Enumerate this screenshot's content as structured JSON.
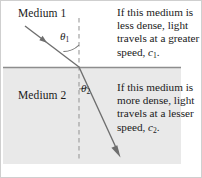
{
  "figure": {
    "background_color": "#ffffff",
    "border_color": "#cfcfcf",
    "ray_color": "#6e6e6e",
    "medium2_fill": "#e8e8e8",
    "interface_line_color": "#8a8a8a",
    "normal_line_color": "#9a9a9a"
  },
  "labels": {
    "medium1": "Medium 1",
    "medium2": "Medium 2",
    "theta1_symbol": "θ",
    "theta1_subscript": "1",
    "theta2_symbol": "θ",
    "theta2_subscript": "2"
  },
  "annotations": {
    "top": {
      "lines": [
        "If this medium is",
        "less dense, light",
        "travels at a greater"
      ],
      "last_line_prefix": "speed, ",
      "last_line_symbol": "c",
      "last_line_subscript": "1",
      "last_line_suffix": "."
    },
    "bottom": {
      "lines": [
        "If this medium is",
        "more dense, light",
        "travels at a lesser"
      ],
      "last_line_prefix": "speed, ",
      "last_line_symbol": "c",
      "last_line_subscript": "2",
      "last_line_suffix": "."
    }
  },
  "geometry": {
    "interface_y": 66,
    "normal_x": 78,
    "incidence_point_x": 78,
    "incidence_point_y": 66,
    "incident_ray_start_x": 24,
    "incident_ray_start_y": 25,
    "refracted_ray_end_x": 119,
    "refracted_ray_end_y": 153,
    "medium2_left": 2,
    "medium2_right": 180,
    "medium2_top": 66,
    "medium2_bottom": 163
  }
}
